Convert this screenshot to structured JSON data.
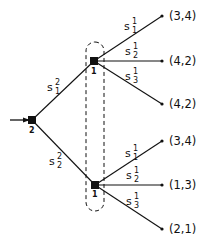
{
  "diagram": {
    "type": "game-tree",
    "root": {
      "player": "2",
      "edges": [
        {
          "label": "s",
          "sub": "1",
          "sup": "2",
          "to": "upper"
        },
        {
          "label": "s",
          "sub": "2",
          "sup": "2",
          "to": "lower"
        }
      ]
    },
    "information_set": {
      "player": "1",
      "members": [
        "upper",
        "lower"
      ]
    },
    "nodes": {
      "upper": {
        "player": "1",
        "edges": [
          {
            "label": "s",
            "sub": "1",
            "sup": "1",
            "payoff": "(3,4)"
          },
          {
            "label": "s",
            "sub": "2",
            "sup": "1",
            "payoff": "(4,2)"
          },
          {
            "label": "s",
            "sub": "3",
            "sup": "1",
            "payoff": "(4,2)"
          }
        ]
      },
      "lower": {
        "player": "1",
        "edges": [
          {
            "label": "s",
            "sub": "1",
            "sup": "1",
            "payoff": "(3,4)"
          },
          {
            "label": "s",
            "sub": "2",
            "sup": "1",
            "payoff": "(1,3)"
          },
          {
            "label": "s",
            "sub": "3",
            "sup": "1",
            "payoff": "(2,1)"
          }
        ]
      }
    }
  }
}
